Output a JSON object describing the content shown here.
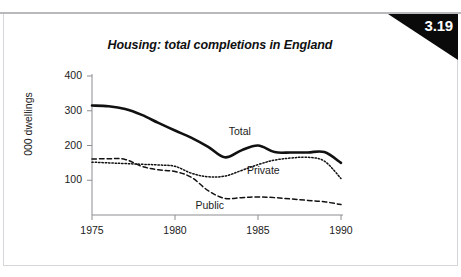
{
  "figure": {
    "number": "3.19",
    "title": "Housing: total completions in England"
  },
  "chart_data": {
    "type": "line",
    "title": "Housing: total completions in England",
    "xlabel": "",
    "ylabel": "000 dwellings",
    "xlim": [
      1975,
      1990
    ],
    "ylim": [
      0,
      400
    ],
    "yticks": [
      100,
      200,
      300,
      400
    ],
    "ytick_labels": [
      "100",
      "200",
      "300",
      "400"
    ],
    "xticks": [
      1975,
      1980,
      1985,
      1990
    ],
    "xtick_labels": [
      "1975",
      "1980",
      "1985",
      "1990"
    ],
    "grid": false,
    "legend": "inline-labels",
    "x": [
      1975,
      1976,
      1977,
      1978,
      1979,
      1980,
      1981,
      1982,
      1983,
      1984,
      1985,
      1986,
      1987,
      1988,
      1989,
      1990
    ],
    "series": [
      {
        "name": "Total",
        "style": "solid-thick",
        "label_x": 1984.2,
        "label_y": 238,
        "values": [
          315,
          313,
          305,
          288,
          265,
          243,
          222,
          196,
          166,
          186,
          200,
          181,
          180,
          180,
          181,
          150
        ]
      },
      {
        "name": "Private",
        "style": "dotted",
        "label_x": 1985.3,
        "label_y": 128,
        "values": [
          152,
          150,
          148,
          146,
          144,
          140,
          120,
          110,
          112,
          128,
          145,
          158,
          164,
          166,
          155,
          105
        ]
      },
      {
        "name": "Public",
        "style": "dashed",
        "label_x": 1982.2,
        "label_y": 26,
        "values": [
          161,
          162,
          160,
          140,
          130,
          125,
          108,
          70,
          48,
          50,
          52,
          50,
          46,
          42,
          38,
          30
        ]
      }
    ]
  }
}
